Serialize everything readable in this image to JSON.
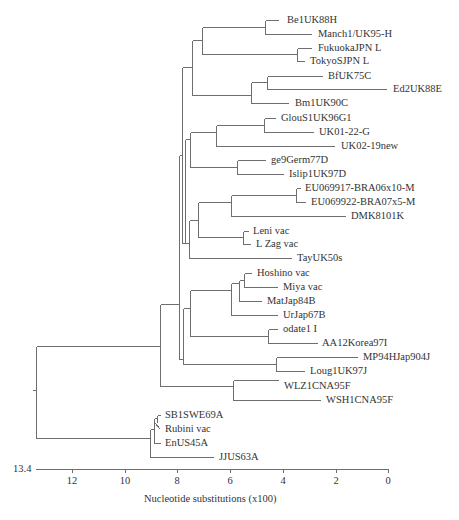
{
  "chart_data": {
    "type": "phylogenetic_tree",
    "title": "",
    "xlabel": "Nucleotide substitutions (x100)",
    "axis": {
      "start_label": "13.4",
      "ticks": [
        "12",
        "10",
        "8",
        "6",
        "4",
        "2",
        "0"
      ],
      "range": [
        13.4,
        0
      ]
    },
    "leaves": [
      "Be1UK88H",
      "Manch1/UK95-H",
      "FukuokaJPN L",
      "TokyoSJPN L",
      "BfUK75C",
      "Ed2UK88E",
      "Bm1UK90C",
      "GlouS1UK96G1",
      "UK01-22-G",
      "UK02-19new",
      "ge9Germ77D",
      "Islip1UK97D",
      "EU069917-BRA06x10-M",
      "EU069922-BRA07x5-M",
      "DMK8101K",
      "Leni vac",
      "L Zag vac",
      "TayUK50s",
      "Hoshino vac",
      "Miya vac",
      "MatJap84B",
      "UrJap67B",
      "odate1 I",
      "AA12Korea97I",
      "MP94HJap904J",
      "Loug1UK97J",
      "WLZ1CNA95F",
      "WSH1CNA95F",
      "SB1SWE69A",
      "Rubini vac",
      "EnUS45A",
      "JJUS63A"
    ],
    "line_color": "#6e6e6e"
  },
  "labels": [
    {
      "text": "Be1UK88H",
      "x": 287,
      "y": 14
    },
    {
      "text": "Manch1/UK95-H",
      "x": 318,
      "y": 28
    },
    {
      "text": "FukuokaJPN L",
      "x": 318,
      "y": 42
    },
    {
      "text": "TokyoSJPN L",
      "x": 310,
      "y": 55
    },
    {
      "text": "BfUK75C",
      "x": 328,
      "y": 70
    },
    {
      "text": "Ed2UK88E",
      "x": 393,
      "y": 83
    },
    {
      "text": "Bm1UK90C",
      "x": 295,
      "y": 97
    },
    {
      "text": "GlouS1UK96G1",
      "x": 281,
      "y": 112
    },
    {
      "text": "UK01-22-G",
      "x": 319,
      "y": 126
    },
    {
      "text": "UK02-19new",
      "x": 341,
      "y": 140
    },
    {
      "text": "ge9Germ77D",
      "x": 271,
      "y": 154
    },
    {
      "text": "Islip1UK97D",
      "x": 289,
      "y": 168
    },
    {
      "text": "EU069917-BRA06x10-M",
      "x": 305,
      "y": 182
    },
    {
      "text": "EU069922-BRA07x5-M",
      "x": 311,
      "y": 196
    },
    {
      "text": "DMK8101K",
      "x": 351,
      "y": 210
    },
    {
      "text": "Leni vac",
      "x": 253,
      "y": 225
    },
    {
      "text": "L Zag vac",
      "x": 256,
      "y": 238
    },
    {
      "text": "TayUK50s",
      "x": 297,
      "y": 252
    },
    {
      "text": "Hoshino vac",
      "x": 257,
      "y": 267
    },
    {
      "text": "Miya vac",
      "x": 283,
      "y": 281
    },
    {
      "text": "MatJap84B",
      "x": 267,
      "y": 295
    },
    {
      "text": "UrJap67B",
      "x": 283,
      "y": 309
    },
    {
      "text": "odate1 I",
      "x": 283,
      "y": 323
    },
    {
      "text": "AA12Korea97I",
      "x": 322,
      "y": 337
    },
    {
      "text": "MP94HJap904J",
      "x": 363,
      "y": 351
    },
    {
      "text": "Loug1UK97J",
      "x": 310,
      "y": 365
    },
    {
      "text": "WLZ1CNA95F",
      "x": 284,
      "y": 380
    },
    {
      "text": "WSH1CNA95F",
      "x": 326,
      "y": 394
    },
    {
      "text": "SB1SWE69A",
      "x": 165,
      "y": 409
    },
    {
      "text": "Rubini vac",
      "x": 165,
      "y": 423
    },
    {
      "text": "EnUS45A",
      "x": 165,
      "y": 437
    },
    {
      "text": "JJUS63A",
      "x": 219,
      "y": 451
    }
  ],
  "segments": [
    [
      32,
      390,
      36,
      390
    ],
    [
      36,
      346,
      36,
      438
    ],
    [
      36,
      346,
      160,
      346
    ],
    [
      160,
      304,
      160,
      386
    ],
    [
      160,
      304,
      179,
      304
    ],
    [
      179,
      155,
      179,
      359
    ],
    [
      36,
      438,
      150,
      438
    ],
    [
      150,
      429,
      150,
      457
    ],
    [
      179,
      155,
      182,
      155
    ],
    [
      182,
      67,
      182,
      243
    ],
    [
      182,
      67,
      192,
      67
    ],
    [
      192,
      40,
      192,
      95
    ],
    [
      192,
      40,
      202,
      40
    ],
    [
      202,
      27,
      202,
      54
    ],
    [
      202,
      27,
      265,
      27
    ],
    [
      265,
      20,
      265,
      34
    ],
    [
      265,
      20,
      278,
      20
    ],
    [
      265,
      34,
      311,
      34
    ],
    [
      202,
      54,
      297,
      54
    ],
    [
      297,
      48,
      297,
      61
    ],
    [
      297,
      48,
      311,
      48
    ],
    [
      297,
      61,
      304,
      61
    ],
    [
      192,
      95,
      251,
      95
    ],
    [
      251,
      82,
      251,
      103
    ],
    [
      251,
      82,
      267,
      82
    ],
    [
      267,
      76,
      267,
      89
    ],
    [
      267,
      76,
      322,
      76
    ],
    [
      267,
      89,
      386,
      89
    ],
    [
      251,
      103,
      288,
      103
    ],
    [
      182,
      243,
      185,
      243
    ],
    [
      185,
      139,
      185,
      243
    ],
    [
      185,
      139,
      190,
      139
    ],
    [
      190,
      132,
      190,
      167
    ],
    [
      190,
      132,
      216,
      132
    ],
    [
      216,
      125,
      216,
      146
    ],
    [
      216,
      125,
      264,
      125
    ],
    [
      264,
      118,
      264,
      132
    ],
    [
      264,
      118,
      275,
      118
    ],
    [
      264,
      132,
      313,
      132
    ],
    [
      216,
      146,
      334,
      146
    ],
    [
      190,
      167,
      237,
      167
    ],
    [
      237,
      160,
      237,
      174
    ],
    [
      237,
      160,
      265,
      160
    ],
    [
      237,
      174,
      283,
      174
    ],
    [
      185,
      243,
      189,
      243
    ],
    [
      189,
      220,
      189,
      258
    ],
    [
      189,
      220,
      198,
      220
    ],
    [
      198,
      202,
      198,
      237
    ],
    [
      198,
      202,
      231,
      202
    ],
    [
      231,
      195,
      231,
      216
    ],
    [
      231,
      195,
      296,
      195
    ],
    [
      296,
      188,
      296,
      202
    ],
    [
      296,
      188,
      300,
      188
    ],
    [
      296,
      202,
      305,
      202
    ],
    [
      231,
      216,
      345,
      216
    ],
    [
      198,
      237,
      243,
      237
    ],
    [
      243,
      231,
      243,
      244
    ],
    [
      243,
      231,
      248,
      231
    ],
    [
      243,
      244,
      250,
      244
    ],
    [
      189,
      258,
      291,
      258
    ],
    [
      179,
      359,
      183,
      359
    ],
    [
      183,
      308,
      183,
      364
    ],
    [
      183,
      308,
      190,
      308
    ],
    [
      190,
      290,
      190,
      336
    ],
    [
      190,
      290,
      231,
      290
    ],
    [
      231,
      283,
      231,
      315
    ],
    [
      231,
      283,
      239,
      283
    ],
    [
      239,
      280,
      239,
      301
    ],
    [
      239,
      280,
      244,
      280
    ],
    [
      244,
      273,
      244,
      287
    ],
    [
      244,
      273,
      251,
      273
    ],
    [
      244,
      287,
      277,
      287
    ],
    [
      239,
      301,
      261,
      301
    ],
    [
      231,
      315,
      277,
      315
    ],
    [
      190,
      336,
      268,
      336
    ],
    [
      268,
      329,
      268,
      343
    ],
    [
      268,
      329,
      277,
      329
    ],
    [
      268,
      343,
      317,
      343
    ],
    [
      183,
      364,
      276,
      364
    ],
    [
      276,
      357,
      276,
      371
    ],
    [
      276,
      357,
      357,
      357
    ],
    [
      276,
      371,
      304,
      371
    ],
    [
      160,
      386,
      233,
      386
    ],
    [
      233,
      380,
      233,
      400
    ],
    [
      233,
      380,
      278,
      380
    ],
    [
      233,
      400,
      320,
      400
    ],
    [
      150,
      429,
      154,
      429
    ],
    [
      154,
      418,
      154,
      443
    ],
    [
      154,
      418,
      157,
      418
    ],
    [
      157,
      415,
      157,
      422
    ],
    [
      157,
      415,
      160,
      415
    ],
    [
      154,
      443,
      160,
      443
    ],
    [
      154,
      422,
      160,
      429
    ],
    [
      150,
      457,
      213,
      457
    ],
    [
      35,
      469,
      388,
      469
    ]
  ],
  "ticks": [
    {
      "label": "12",
      "x": 72
    },
    {
      "label": "10",
      "x": 125
    },
    {
      "label": "8",
      "x": 177
    },
    {
      "label": "6",
      "x": 230
    },
    {
      "label": "4",
      "x": 283
    },
    {
      "label": "2",
      "x": 336
    },
    {
      "label": "0",
      "x": 388
    }
  ],
  "axis_start": {
    "label": "13.4",
    "x": 13,
    "y": 463
  },
  "axis_title": {
    "text": "Nucleotide substitutions (x100)",
    "x": 144,
    "y": 493
  }
}
